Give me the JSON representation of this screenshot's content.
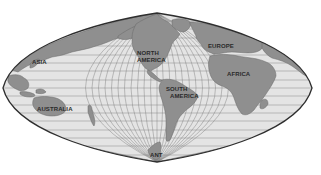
{
  "map": {
    "projection": "sinusoidal",
    "colors": {
      "ocean": "#e4e4e4",
      "land": "#8f8f8f",
      "graticule": "#7d7d7d",
      "outline": "#2e2e2e",
      "label": "#2a2a2a"
    },
    "labels": {
      "asia": "ASIA",
      "north_america_1": "NORTH",
      "north_america_2": "AMERICA",
      "europe": "EUROPE",
      "africa": "AFRICA",
      "south_america_1": "SOUTH",
      "south_america_2": "AMERICA",
      "australia": "AUSTRALIA",
      "antarctica": "ANT"
    }
  }
}
